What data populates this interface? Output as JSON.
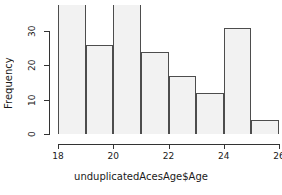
{
  "chart_data": {
    "type": "bar",
    "title": "",
    "xlabel": "unduplicatedAcesAge$Age",
    "ylabel": "Frequency",
    "categories": [
      "18-19",
      "19-20",
      "20-21",
      "21-22",
      "22-23",
      "23-24",
      "24-25",
      "25-26"
    ],
    "bin_edges": [
      18,
      19,
      20,
      21,
      22,
      23,
      24,
      25,
      26
    ],
    "values": [
      38,
      26,
      38,
      24,
      17,
      12,
      31,
      4
    ],
    "xlim": [
      18,
      26
    ],
    "ylim": [
      0,
      38
    ],
    "y_ticks": [
      0,
      10,
      20,
      30
    ],
    "x_ticks": [
      18,
      20,
      22,
      24,
      26
    ],
    "grid": false,
    "legend": false,
    "bar_fill_color": "#f2f2f2",
    "bar_border_color": "#4d4d4d",
    "axis_color": "#333333",
    "background_color": "#ffffff",
    "note": "Histogram bars for bins 18-19 and 20-21 are clipped by the top of the plot region"
  },
  "axes": {
    "y_tick_labels": [
      "0",
      "10",
      "20",
      "30"
    ],
    "x_tick_labels": [
      "18",
      "20",
      "22",
      "24",
      "26"
    ],
    "y_title": "Frequency",
    "x_title": "unduplicatedAcesAge$Age"
  }
}
